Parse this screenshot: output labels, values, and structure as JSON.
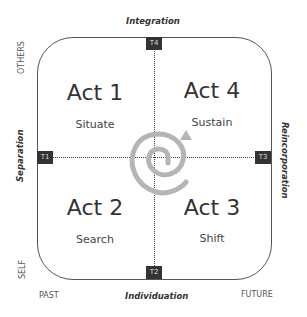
{
  "axes": {
    "top": "Integration",
    "bottom": "Individuation",
    "left": "Separation",
    "right": "Reincorporation"
  },
  "corners": {
    "top_left": "OTHERS",
    "bottom_left": "SELF",
    "bottom_left_x": "PAST",
    "bottom_right": "FUTURE"
  },
  "markers": {
    "top": "T4",
    "left": "T1",
    "right": "T3",
    "bottom": "T2"
  },
  "quadrants": [
    {
      "position": "top-left",
      "act": "Act 1",
      "label": "Situate"
    },
    {
      "position": "top-right",
      "act": "Act 4",
      "label": "Sustain"
    },
    {
      "position": "bottom-left",
      "act": "Act 2",
      "label": "Search"
    },
    {
      "position": "bottom-right",
      "act": "Act 3",
      "label": "Shift"
    }
  ],
  "spiral": {
    "color": "#b5b5b5",
    "direction": "outward-clockwise-arrow-up"
  }
}
